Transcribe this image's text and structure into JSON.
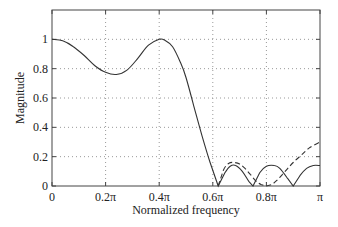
{
  "chart_data": {
    "type": "line",
    "title": "",
    "xlabel": "Normalized frequency",
    "ylabel": "Magnitude",
    "xlim": [
      0,
      1
    ],
    "ylim": [
      0,
      1.2
    ],
    "grid": true,
    "x_ticks": [
      0,
      0.2,
      0.4,
      0.6,
      0.8,
      1.0
    ],
    "x_tick_labels": [
      "0",
      "0.2π",
      "0.4π",
      "0.6π",
      "0.8π",
      "π"
    ],
    "y_ticks": [
      0,
      0.2,
      0.4,
      0.6,
      0.8,
      1.0
    ],
    "y_tick_labels": [
      "0",
      "0.2",
      "0.4",
      "0.6",
      "0.8",
      "1"
    ],
    "series": [
      {
        "name": "solid",
        "style": "solid",
        "x": [
          0,
          0.04,
          0.08,
          0.12,
          0.16,
          0.2,
          0.24,
          0.28,
          0.32,
          0.36,
          0.4,
          0.42,
          0.45,
          0.48,
          0.5,
          0.53,
          0.56,
          0.59,
          0.62,
          0.645,
          0.665,
          0.685,
          0.71,
          0.735,
          0.75,
          0.775,
          0.8,
          0.83,
          0.85,
          0.88,
          0.9,
          0.925,
          0.95,
          0.975,
          1.0
        ],
        "y": [
          1.0,
          0.99,
          0.95,
          0.89,
          0.82,
          0.775,
          0.76,
          0.79,
          0.87,
          0.96,
          1.0,
          0.995,
          0.95,
          0.84,
          0.74,
          0.54,
          0.34,
          0.16,
          0.0,
          0.09,
          0.135,
          0.14,
          0.1,
          0.03,
          0.0,
          0.09,
          0.135,
          0.14,
          0.12,
          0.05,
          0.0,
          0.07,
          0.12,
          0.14,
          0.14
        ]
      },
      {
        "name": "dashed",
        "style": "dashed",
        "x": [
          0.62,
          0.64,
          0.66,
          0.68,
          0.7,
          0.72,
          0.74,
          0.76,
          0.78,
          0.8,
          0.82,
          0.84,
          0.86,
          0.88,
          0.9,
          0.93,
          0.96,
          1.0
        ],
        "y": [
          0.0,
          0.11,
          0.155,
          0.16,
          0.15,
          0.12,
          0.08,
          0.035,
          0.01,
          0.0,
          0.01,
          0.04,
          0.08,
          0.12,
          0.16,
          0.21,
          0.26,
          0.3
        ]
      }
    ]
  }
}
